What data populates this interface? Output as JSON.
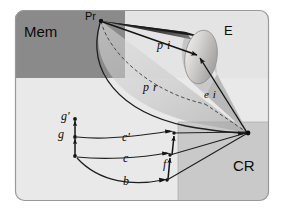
{
  "figure": {
    "background": "#ffffff",
    "panel": {
      "fill": "#e9e9e9",
      "border": "#9a9a9a",
      "x": 15,
      "y": 10,
      "w": 254,
      "h": 191,
      "radius": 9
    },
    "regions": [
      {
        "name": "mem-block",
        "label": "Mem",
        "fill": "#8a8a8a",
        "x": 15,
        "y": 10,
        "w": 110,
        "h": 68
      },
      {
        "name": "upper-right-block",
        "label": "",
        "fill": "#e3e3e3",
        "x": 125,
        "y": 10,
        "w": 144,
        "h": 68
      },
      {
        "name": "cr-block",
        "label": "CR",
        "fill": "#c9c9c9",
        "x": 178,
        "y": 122,
        "w": 91,
        "h": 79
      }
    ],
    "labels": [
      {
        "name": "label-mem",
        "text": "Mem",
        "x": 24,
        "y": 24,
        "size": 15,
        "style": "sans"
      },
      {
        "name": "label-pr-point",
        "text": "Pr",
        "x": 85,
        "y": 11,
        "size": 11,
        "style": "sans"
      },
      {
        "name": "label-e",
        "text": "E",
        "x": 224,
        "y": 24,
        "size": 13,
        "style": "sans"
      },
      {
        "name": "label-cr",
        "text": "CR",
        "x": 233,
        "y": 158,
        "size": 15,
        "style": "sans"
      },
      {
        "name": "label-pi",
        "text": "p i",
        "x": 157,
        "y": 39,
        "size": 12,
        "style": "serif-i"
      },
      {
        "name": "label-pr",
        "text": "p r",
        "x": 143,
        "y": 81,
        "size": 12,
        "style": "serif-i"
      },
      {
        "name": "label-ei",
        "text": "e i",
        "x": 204,
        "y": 89,
        "size": 11,
        "style": "serif-i"
      },
      {
        "name": "label-g-prime",
        "text": "g'",
        "x": 61,
        "y": 110,
        "size": 12,
        "style": "serif-i"
      },
      {
        "name": "label-g",
        "text": "g",
        "x": 58,
        "y": 128,
        "size": 12,
        "style": "serif-i"
      },
      {
        "name": "label-c-prime",
        "text": "c'",
        "x": 122,
        "y": 131,
        "size": 12,
        "style": "serif-i"
      },
      {
        "name": "label-c",
        "text": "c",
        "x": 123,
        "y": 152,
        "size": 12,
        "style": "serif-i"
      },
      {
        "name": "label-b",
        "text": "b",
        "x": 123,
        "y": 175,
        "size": 12,
        "style": "serif-i"
      },
      {
        "name": "label-f",
        "text": "f",
        "x": 163,
        "y": 158,
        "size": 12,
        "style": "serif-i"
      }
    ],
    "points": {
      "pr_apex": {
        "x": 101,
        "y": 21
      },
      "cr_vertex": {
        "x": 248,
        "y": 133
      },
      "e_center": {
        "x": 200,
        "y": 56
      },
      "g_prime": {
        "x": 75,
        "y": 119
      },
      "g": {
        "x": 75,
        "y": 137
      },
      "b_start": {
        "x": 75,
        "y": 156
      },
      "f_top": {
        "x": 174,
        "y": 133
      },
      "f_mid": {
        "x": 170,
        "y": 155
      },
      "f_bot": {
        "x": 167,
        "y": 180
      }
    },
    "colors": {
      "stroke": "#1a1a1a",
      "cone_dark": "#2e2e2e",
      "cone_light": "#d9d9d9",
      "panel_fill": "#e9e9e9",
      "mem_fill": "#8a8a8a",
      "cr_fill": "#c9c9c9"
    }
  }
}
